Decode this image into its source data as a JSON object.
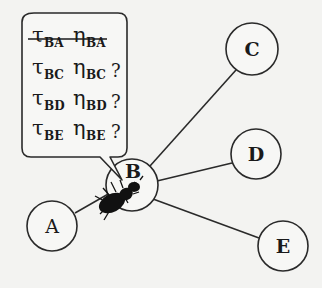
{
  "diagram": {
    "nodes": [
      {
        "id": "A",
        "label": "A",
        "cx": 52,
        "cy": 226,
        "r": 25
      },
      {
        "id": "B",
        "label": "B",
        "cx": 132,
        "cy": 185,
        "r": 26
      },
      {
        "id": "C",
        "label": "C",
        "cx": 252,
        "cy": 49,
        "r": 26
      },
      {
        "id": "D",
        "label": "D",
        "cx": 256,
        "cy": 154,
        "r": 25
      },
      {
        "id": "E",
        "label": "E",
        "cx": 283,
        "cy": 246,
        "r": 25
      }
    ],
    "edges": [
      {
        "from": "B",
        "to": "A"
      },
      {
        "from": "B",
        "to": "C"
      },
      {
        "from": "B",
        "to": "D"
      },
      {
        "from": "B",
        "to": "E"
      }
    ],
    "agent": {
      "icon": "ant-icon",
      "location": "B"
    },
    "bubble": {
      "rows": [
        {
          "tau": "τ",
          "tau_sub": "BA",
          "eta": "η",
          "eta_sub": "BA",
          "mark": "",
          "struck": true
        },
        {
          "tau": "τ",
          "tau_sub": "BC",
          "eta": "η",
          "eta_sub": "BC",
          "mark": "?",
          "struck": false
        },
        {
          "tau": "τ",
          "tau_sub": "BD",
          "eta": "η",
          "eta_sub": "BD",
          "mark": "?",
          "struck": false
        },
        {
          "tau": "τ",
          "tau_sub": "BE",
          "eta": "η",
          "eta_sub": "BE",
          "mark": "?",
          "struck": false
        }
      ]
    }
  }
}
